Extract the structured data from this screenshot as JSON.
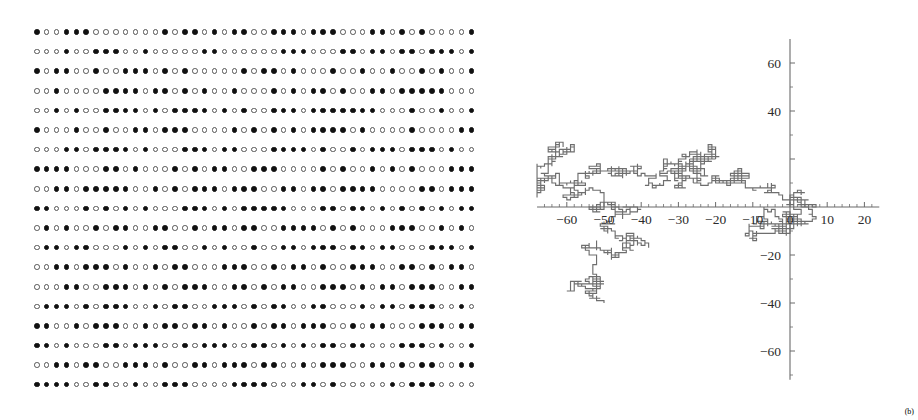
{
  "figure": {
    "title": "",
    "panels": [
      {
        "id": "bit-lattice",
        "kind": "dot-matrix"
      },
      {
        "id": "random-walk",
        "kind": "line-plot"
      }
    ]
  },
  "bit_lattice": {
    "rows": 19,
    "columns": 45,
    "filled_symbol": "filled-circle",
    "empty_symbol": "open-circle",
    "filled_color": "#111111",
    "empty_color": "#555555",
    "matrix": [
      "100111000000010110101100111011100011010100001101111011",
      "000100111001000001100000011100011011011011101101000001",
      "101100100111010100000101101000100100100101001010011011",
      "001000011110110101001000101011010011011111000001100111",
      "001010011110101111010100111011111110001001001011100",
      "100010010011011100001010101011110100001000011010001",
      "000110111101000111011000111101001011101110100101110",
      "111100011010001010110011100001010010101000111011100110",
      "001101111100101011101110011011011110000110111010011110",
      "110001010101000111010111110001101101010101011100101100",
      "010100101100110010110110011110101000111001010110001011",
      "011011000101011001010010011011101101100011101000101101",
      "001101110100101100011100101101001110011010110011101",
      "000110011101010111001101011001110101101110011000110",
      "011101011100101100111010110011000101101110010110101",
      "110010111001011011010010110111001011000111011010011",
      "110100011011100101110011010101101100011101001101110",
      "001101100111010011011101100101110011010110011101101",
      "111100110010011100001111000110100000101110000000000"
    ]
  },
  "chart_data": {
    "type": "line",
    "title": "",
    "xlabel": "",
    "ylabel": "",
    "xlim": [
      -68,
      24
    ],
    "ylim": [
      -72,
      70
    ],
    "grid": false,
    "legend": null,
    "axes": {
      "x_axis_position_y": 0,
      "y_axis_position_x": 0,
      "x_ticks": [
        -60,
        -50,
        -40,
        -30,
        -20,
        -10,
        0,
        10,
        20
      ],
      "x_tick_labels": [
        "-60",
        "-50",
        "-40",
        "-30",
        "-20",
        "-10",
        "0",
        "10",
        "20"
      ],
      "y_ticks": [
        -60,
        -40,
        -20,
        20,
        40,
        60
      ],
      "y_tick_labels": [
        "-60",
        "-40",
        "-20",
        "",
        "",
        "40",
        "60"
      ],
      "y_tick_labels_visible": [
        "60",
        "40",
        "-20",
        "-40",
        "-60"
      ],
      "x_minor_step": 2,
      "y_minor_step": 10
    },
    "series": [
      {
        "name": "random-walk",
        "color": "#6e6e6e",
        "description": "2D lattice random walk trajectory starting near the origin",
        "start": [
          0,
          0
        ],
        "n_steps": 2400,
        "step_size": 1
      }
    ]
  },
  "corner": {
    "mark": "(b)"
  }
}
